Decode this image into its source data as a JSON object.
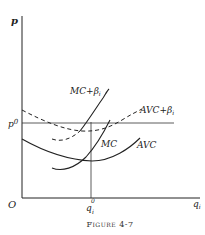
{
  "figure": {
    "caption": "Figure 4-7",
    "axes": {
      "y_label": "p",
      "x_label": "q",
      "x_label_sub": "i",
      "origin_label": "O"
    },
    "price_level": {
      "label": "p",
      "sup": "0"
    },
    "quantity_level": {
      "label": "q",
      "sub": "i",
      "sup": "0"
    },
    "curves": [
      {
        "id": "mc-plus-beta",
        "label": "MC+β",
        "label_sub": "i",
        "style": "solid"
      },
      {
        "id": "avc-plus-beta",
        "label": "AVC+β",
        "label_sub": "i",
        "style": "dashed"
      },
      {
        "id": "mc",
        "label": "MC",
        "style": "solid"
      },
      {
        "id": "avc",
        "label": "AVC",
        "style": "solid"
      }
    ],
    "colors": {
      "ink": "#222222",
      "background": "#ffffff"
    }
  }
}
